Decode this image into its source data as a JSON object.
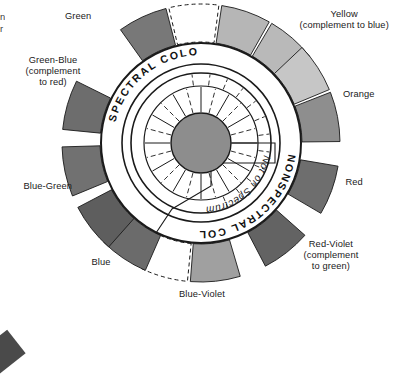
{
  "figure": {
    "title_hidden": "",
    "center_hub": {
      "fill": "#8d8d8d",
      "stroke": "#1a1a1a"
    },
    "ring_outer": {
      "fill": "#ffffff",
      "stroke": "#1a1a1a"
    },
    "ring_inner": {
      "fill": "#ffffff",
      "stroke": "#1a1a1a"
    },
    "band_labels": {
      "spectral": "SPECTRAL COLORS",
      "nonspectral": "NONSPECTRAL COLORS",
      "not_on_spectrum": "Not on Spectrum"
    },
    "petals": [
      {
        "name": "green",
        "color": "#787878",
        "angle_deg": -115
      },
      {
        "name": "green-yellow",
        "color": "#ffffff",
        "angle_deg": -93
      },
      {
        "name": "yellow-green",
        "color": "#b6b6b6",
        "angle_deg": -71
      },
      {
        "name": "yellow",
        "color": "#b9b9b9",
        "angle_deg": -49
      },
      {
        "name": "yellow-light",
        "color": "#c6c6c6",
        "angle_deg": -33
      },
      {
        "name": "orange",
        "color": "#8e8e8e",
        "angle_deg": -11
      },
      {
        "name": "red",
        "color": "#6e6e6e",
        "angle_deg": 20
      },
      {
        "name": "red-violet",
        "color": "#636363",
        "angle_deg": 52
      },
      {
        "name": "blue-violet",
        "color": "#a0a0a0",
        "angle_deg": 84
      },
      {
        "name": "violet-gap",
        "color": "#ffffff",
        "angle_deg": 106
      },
      {
        "name": "blue",
        "color": "#6b6b6b",
        "angle_deg": 124
      },
      {
        "name": "blue-deep",
        "color": "#5e5e5e",
        "angle_deg": 142
      },
      {
        "name": "blue-green",
        "color": "#717171",
        "angle_deg": 168
      },
      {
        "name": "green-blue",
        "color": "#6d6d6d",
        "angle_deg": 196
      }
    ],
    "labels": [
      {
        "id": "green",
        "lines": [
          "Green"
        ],
        "x": 78,
        "y": 16,
        "align": "center"
      },
      {
        "id": "yellow",
        "lines": [
          "Yellow",
          "(complement to blue)"
        ],
        "x": 344,
        "y": 20,
        "align": "center"
      },
      {
        "id": "orange",
        "lines": [
          "Orange"
        ],
        "x": 359,
        "y": 94,
        "align": "center"
      },
      {
        "id": "red",
        "lines": [
          "Red"
        ],
        "x": 354,
        "y": 182,
        "align": "center"
      },
      {
        "id": "red-violet",
        "lines": [
          "Red-Violet",
          "(complement",
          "to green)"
        ],
        "x": 331,
        "y": 256,
        "align": "center"
      },
      {
        "id": "blue-violet",
        "lines": [
          "Blue-Violet"
        ],
        "x": 202,
        "y": 294,
        "align": "center"
      },
      {
        "id": "blue",
        "lines": [
          "Blue"
        ],
        "x": 101,
        "y": 262,
        "align": "center"
      },
      {
        "id": "blue-green",
        "lines": [
          "Blue-Green"
        ],
        "x": 48,
        "y": 186,
        "align": "center"
      },
      {
        "id": "green-blue",
        "lines": [
          "Green-Blue",
          "(complement",
          "to red)"
        ],
        "x": 53,
        "y": 72,
        "align": "center"
      }
    ],
    "clipped_fragment": {
      "lines": [
        "n",
        "r"
      ],
      "x": 0,
      "y": 12
    },
    "colors": {
      "ink": "#1a1a1a",
      "paper": "#ffffff",
      "hub": "#8d8d8d",
      "corner_mark": "#4a4a4a"
    }
  }
}
